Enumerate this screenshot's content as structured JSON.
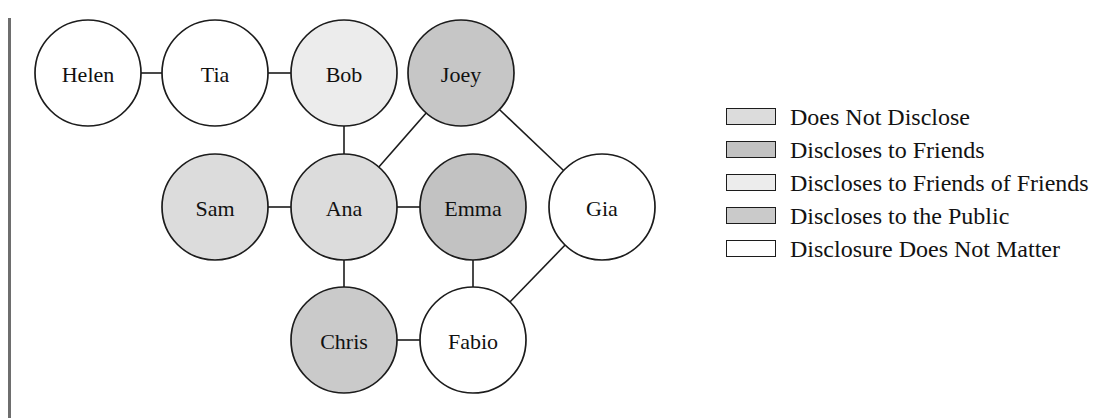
{
  "figure": {
    "type": "social-network-diagram",
    "background_color": "#ffffff",
    "left_rule_color": "#6e6e6e"
  },
  "chart_data": {
    "type": "diagram",
    "title": "",
    "layout": "node-link social network graph with disclosure-level legend",
    "node_radius": 53,
    "nodes": [
      {
        "id": "helen",
        "label": "Helen",
        "x": 88,
        "y": 73,
        "category": "disclosure_does_not_matter",
        "fill": "#ffffff"
      },
      {
        "id": "tia",
        "label": "Tia",
        "x": 215,
        "y": 73,
        "category": "disclosure_does_not_matter",
        "fill": "#ffffff"
      },
      {
        "id": "bob",
        "label": "Bob",
        "x": 344,
        "y": 73,
        "category": "discloses_to_friends_of_friends",
        "fill": "#ececec"
      },
      {
        "id": "joey",
        "label": "Joey",
        "x": 461,
        "y": 73,
        "category": "discloses_to_friends",
        "fill": "#c6c6c6"
      },
      {
        "id": "sam",
        "label": "Sam",
        "x": 215,
        "y": 207,
        "category": "does_not_disclose",
        "fill": "#dcdcdc"
      },
      {
        "id": "ana",
        "label": "Ana",
        "x": 344,
        "y": 207,
        "category": "does_not_disclose",
        "fill": "#dcdcdc"
      },
      {
        "id": "emma",
        "label": "Emma",
        "x": 473,
        "y": 207,
        "category": "discloses_to_friends",
        "fill": "#c2c2c2"
      },
      {
        "id": "gia",
        "label": "Gia",
        "x": 602,
        "y": 207,
        "category": "disclosure_does_not_matter",
        "fill": "#ffffff"
      },
      {
        "id": "chris",
        "label": "Chris",
        "x": 344,
        "y": 340,
        "category": "discloses_to_the_public",
        "fill": "#cacaca"
      },
      {
        "id": "fabio",
        "label": "Fabio",
        "x": 473,
        "y": 340,
        "category": "disclosure_does_not_matter",
        "fill": "#ffffff"
      }
    ],
    "edges": [
      {
        "source": "helen",
        "target": "tia"
      },
      {
        "source": "tia",
        "target": "bob"
      },
      {
        "source": "bob",
        "target": "ana"
      },
      {
        "source": "ana",
        "target": "joey"
      },
      {
        "source": "joey",
        "target": "gia"
      },
      {
        "source": "sam",
        "target": "ana"
      },
      {
        "source": "ana",
        "target": "emma"
      },
      {
        "source": "ana",
        "target": "chris"
      },
      {
        "source": "emma",
        "target": "fabio"
      },
      {
        "source": "chris",
        "target": "fabio"
      },
      {
        "source": "fabio",
        "target": "gia"
      }
    ],
    "legend": {
      "position": "right",
      "entries": [
        {
          "label": "Does Not Disclose",
          "color": "#dcdcdc"
        },
        {
          "label": "Discloses to Friends",
          "color": "#c2c2c2"
        },
        {
          "label": "Discloses to Friends of Friends",
          "color": "#ececec"
        },
        {
          "label": "Discloses to the Public",
          "color": "#cacaca"
        },
        {
          "label": "Disclosure Does Not Matter",
          "color": "#ffffff"
        }
      ]
    }
  }
}
